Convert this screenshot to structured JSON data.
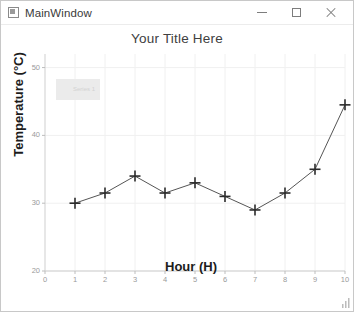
{
  "window": {
    "title": "MainWindow",
    "icon": "application-icon",
    "controls": {
      "minimize": "−",
      "maximize": "□",
      "close": "×"
    }
  },
  "chart_data": {
    "type": "line",
    "title": "Your Title Here",
    "xlabel": "Hour (H)",
    "ylabel": "Temperature (°C)",
    "x": [
      1,
      2,
      3,
      4,
      5,
      6,
      7,
      8,
      9,
      10
    ],
    "values": [
      30,
      31.5,
      34,
      31.5,
      33,
      31,
      29,
      31.5,
      35,
      44.5
    ],
    "series": [
      {
        "name": "Series 1",
        "values": [
          30,
          31.5,
          34,
          31.5,
          33,
          31,
          29,
          31.5,
          35,
          44.5
        ]
      }
    ],
    "xlim": [
      0,
      10
    ],
    "ylim": [
      20,
      52
    ],
    "xticks": [
      0,
      1,
      2,
      3,
      4,
      5,
      6,
      7,
      8,
      9,
      10
    ],
    "xtick_labels": [
      "0",
      "1",
      "2",
      "3",
      "4",
      "5",
      "6",
      "7",
      "8",
      "9",
      "10"
    ],
    "yticks": [
      20,
      30,
      40,
      50
    ],
    "ytick_labels": [
      "20",
      "30",
      "40",
      "50"
    ],
    "grid": true,
    "marker": "plus",
    "line_color": "#555555",
    "marker_color": "#2b2b2b",
    "grid_color": "#f0f0f0",
    "legend": {
      "visible": true,
      "position": "upper-left",
      "label": "Series 1",
      "background": "#ebebeb"
    }
  }
}
